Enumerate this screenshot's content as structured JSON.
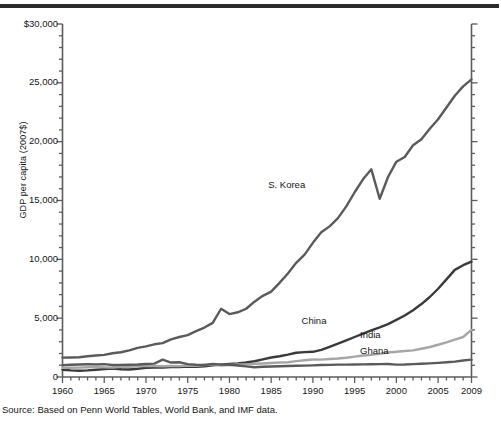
{
  "figure": {
    "source_note": "Source: Based on Penn World Tables, World Bank, and IMF data.",
    "top_rule_color": "#2b2b2b"
  },
  "chart_data": {
    "type": "line",
    "title": "",
    "subtitle": "",
    "xlabel": "",
    "ylabel": "GDP per capita (2007$)",
    "xlim": [
      1960,
      2009
    ],
    "ylim": [
      0,
      30000
    ],
    "grid": false,
    "legend_position": "inline-labels",
    "y_ticks": [
      0,
      5000,
      10000,
      15000,
      20000,
      25000,
      30000
    ],
    "y_tick_labels": [
      "0",
      "5,000",
      "10,000",
      "15,000",
      "20,000",
      "25,000",
      "$30,000"
    ],
    "y_minor_tick_step": 1000,
    "x_ticks": [
      1960,
      1965,
      1970,
      1975,
      1980,
      1985,
      1990,
      1995,
      2000,
      2005,
      2009
    ],
    "x_tick_labels": [
      "1960",
      "1965",
      "1970",
      "1975",
      "1980",
      "1985",
      "1990",
      "1995",
      "2000",
      "2005",
      "2009"
    ],
    "x_minor_tick_step": 1,
    "x": [
      1960,
      1961,
      1962,
      1963,
      1964,
      1965,
      1966,
      1967,
      1968,
      1969,
      1970,
      1971,
      1972,
      1973,
      1974,
      1975,
      1976,
      1977,
      1978,
      1979,
      1980,
      1981,
      1982,
      1983,
      1984,
      1985,
      1986,
      1987,
      1988,
      1989,
      1990,
      1991,
      1992,
      1993,
      1994,
      1995,
      1996,
      1997,
      1998,
      1999,
      2000,
      2001,
      2002,
      2003,
      2004,
      2005,
      2006,
      2007,
      2008,
      2009
    ],
    "series": [
      {
        "name": "S. Korea",
        "color": "#5a5a5a",
        "label_x": 1988,
        "label_y": 16300,
        "values": [
          1650,
          1660,
          1680,
          1760,
          1830,
          1880,
          2020,
          2100,
          2260,
          2470,
          2600,
          2780,
          2880,
          3200,
          3400,
          3560,
          3900,
          4200,
          4600,
          5800,
          5350,
          5500,
          5800,
          6400,
          6900,
          7250,
          8000,
          8800,
          9700,
          10400,
          11400,
          12300,
          12800,
          13500,
          14500,
          15700,
          16800,
          17650,
          15150,
          17000,
          18300,
          18700,
          19700,
          20200,
          21100,
          21900,
          22900,
          23900,
          24700,
          25300
        ]
      },
      {
        "name": "China",
        "color": "#3a3a3a",
        "label_x": 1992,
        "label_y": 4700,
        "values": [
          620,
          560,
          530,
          560,
          610,
          670,
          710,
          660,
          640,
          700,
          780,
          800,
          810,
          850,
          850,
          890,
          870,
          910,
          990,
          1050,
          1110,
          1150,
          1230,
          1340,
          1500,
          1660,
          1760,
          1900,
          2060,
          2110,
          2140,
          2300,
          2560,
          2830,
          3110,
          3400,
          3680,
          3960,
          4220,
          4500,
          4850,
          5230,
          5680,
          6200,
          6800,
          7500,
          8300,
          9100,
          9500,
          9800
        ]
      },
      {
        "name": "India",
        "color": "#a6a6a6",
        "label_x": 1999,
        "label_y": 3500,
        "values": [
          780,
          790,
          800,
          830,
          870,
          820,
          810,
          860,
          870,
          910,
          950,
          940,
          910,
          940,
          920,
          980,
          960,
          1020,
          1050,
          970,
          1020,
          1060,
          1070,
          1120,
          1150,
          1190,
          1230,
          1250,
          1350,
          1420,
          1490,
          1480,
          1530,
          1570,
          1640,
          1730,
          1830,
          1880,
          1970,
          2080,
          2140,
          2210,
          2260,
          2400,
          2550,
          2740,
          2950,
          3180,
          3400,
          4000
        ]
      },
      {
        "name": "Ghana",
        "color": "#5a5a5a",
        "label_x": 1999,
        "label_y": 2150,
        "values": [
          1010,
          1040,
          1060,
          1080,
          1070,
          1090,
          1020,
          1030,
          1040,
          1060,
          1110,
          1140,
          1480,
          1230,
          1250,
          1090,
          1040,
          1030,
          1100,
          1050,
          1040,
          980,
          900,
          830,
          870,
          890,
          910,
          930,
          950,
          970,
          990,
          1020,
          1030,
          1050,
          1050,
          1060,
          1070,
          1080,
          1090,
          1100,
          1050,
          1060,
          1090,
          1120,
          1160,
          1200,
          1250,
          1310,
          1400,
          1480
        ]
      }
    ]
  }
}
